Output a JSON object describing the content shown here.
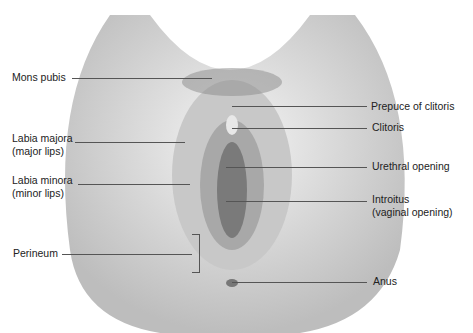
{
  "diagram": {
    "labels_left": [
      {
        "id": "mons",
        "lines": [
          "Mons pubis"
        ]
      },
      {
        "id": "labia-majora",
        "lines": [
          "Labia majora",
          "(major lips)"
        ]
      },
      {
        "id": "labia-minora",
        "lines": [
          "Labia minora",
          "(minor lips)"
        ]
      },
      {
        "id": "perineum",
        "lines": [
          "Perineum"
        ]
      }
    ],
    "labels_right": [
      {
        "id": "prepuce",
        "lines": [
          "Prepuce of clitoris"
        ]
      },
      {
        "id": "clitoris",
        "lines": [
          "Clitoris"
        ]
      },
      {
        "id": "urethral",
        "lines": [
          "Urethral opening"
        ]
      },
      {
        "id": "introitus",
        "lines": [
          "Introitus",
          "(vaginal opening)"
        ]
      },
      {
        "id": "anus",
        "lines": [
          "Anus"
        ]
      }
    ],
    "colors": {
      "skin": "#d9d9d9",
      "shade": "#9a9a9a",
      "line": "#555555",
      "text": "#222222"
    }
  }
}
